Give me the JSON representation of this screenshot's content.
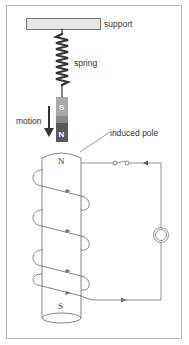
{
  "diagram": {
    "labels": {
      "support": "support",
      "spring": "spring",
      "motion": "motion",
      "induced_pole": "induced pole"
    },
    "magnet": {
      "top_pole": "S",
      "bottom_pole": "N"
    },
    "solenoid": {
      "top_pole": "N",
      "bottom_pole": "S",
      "turns": 5
    },
    "circuit": {
      "components": [
        "switch",
        "galvanometer"
      ]
    },
    "colors": {
      "frame": "#b5b5b5",
      "support_fill": "#e6e6e6",
      "spring": "#333333",
      "magnet_s": "#a8a8a8",
      "magnet_mid": "#8a8a8a",
      "magnet_n": "#5a5a5a",
      "wire": "#888888",
      "arrow": "#333333"
    }
  }
}
